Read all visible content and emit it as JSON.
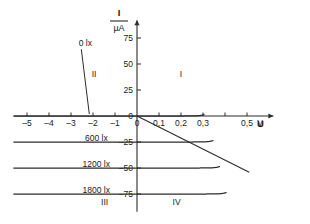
{
  "chart_data": {
    "type": "line",
    "title": "",
    "xlabel": "U",
    "x_unit": "V",
    "ylabel": "I",
    "y_unit": "µA",
    "xlim": [
      -5.6,
      0.62
    ],
    "ylim": [
      -92,
      92
    ],
    "grid": false,
    "legend_position": "inline-on-curves",
    "x_ticks": [
      {
        "value": -5,
        "label": "–5"
      },
      {
        "value": -4,
        "label": "–4"
      },
      {
        "value": -3,
        "label": "–3"
      },
      {
        "value": -2,
        "label": "–2"
      },
      {
        "value": -1,
        "label": "–1"
      },
      {
        "value": 0,
        "label": "0"
      },
      {
        "value": 0.1,
        "label": "0,1"
      },
      {
        "value": 0.2,
        "label": "0,2"
      },
      {
        "value": 0.3,
        "label": "0,3"
      },
      {
        "value": 0.4,
        "label": ""
      },
      {
        "value": 0.5,
        "label": "0,5"
      }
    ],
    "y_ticks": [
      {
        "value": 75,
        "label": "75"
      },
      {
        "value": 50,
        "label": "50"
      },
      {
        "value": 25,
        "label": "25"
      },
      {
        "value": 0,
        "label": "0"
      },
      {
        "value": -25,
        "label": "–25"
      },
      {
        "value": -50,
        "label": "–50"
      },
      {
        "value": -75,
        "label": "–75"
      }
    ],
    "series": [
      {
        "name": "0 lx",
        "illuminance": 0,
        "reverse_current": 0,
        "knee_voltage": 0.3
      },
      {
        "name": "600 lx",
        "illuminance": 600,
        "reverse_current": -25,
        "knee_voltage": 0.34
      },
      {
        "name": "1200 lx",
        "illuminance": 1200,
        "reverse_current": -50,
        "knee_voltage": 0.37
      },
      {
        "name": "1800 lx",
        "illuminance": 1800,
        "reverse_current": -75,
        "knee_voltage": 0.4
      }
    ],
    "load_line": {
      "name": "load line",
      "from": [
        0,
        0
      ],
      "to": [
        0.51,
        -54
      ]
    },
    "annotations": [
      {
        "text": "0 lx",
        "x": -2.35,
        "y": 70,
        "has_leader": true
      },
      {
        "text": "600 lx",
        "x": -1.85,
        "y": -21,
        "has_leader": false
      },
      {
        "text": "1200 lx",
        "x": -1.85,
        "y": -46,
        "has_leader": false
      },
      {
        "text": "1800 lx",
        "x": -1.85,
        "y": -71,
        "has_leader": false
      }
    ],
    "quadrants": [
      {
        "label": "I",
        "x": 0.2,
        "y": 40
      },
      {
        "label": "II",
        "x": -1.95,
        "y": 40
      },
      {
        "label": "III",
        "x": -1.47,
        "y": -83
      },
      {
        "label": "IV",
        "x": 0.18,
        "y": -83
      }
    ]
  },
  "colors": {
    "background": "#ffffff",
    "axis": "#2b2b2b",
    "curve": "#2b2b2b",
    "text": "#1a1a1a"
  }
}
